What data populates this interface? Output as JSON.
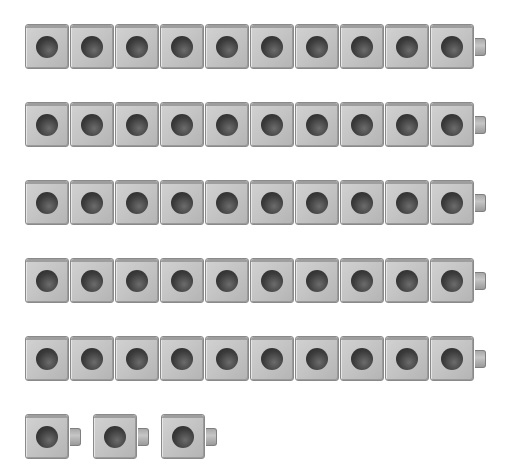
{
  "diagram": {
    "colors": {
      "cube": "#c4c4c4",
      "hole": "#333333",
      "background": "#ffffff"
    },
    "rods": [
      {
        "cubes": 10,
        "top": 24
      },
      {
        "cubes": 10,
        "top": 102
      },
      {
        "cubes": 10,
        "top": 180
      },
      {
        "cubes": 10,
        "top": 258
      },
      {
        "cubes": 10,
        "top": 336
      }
    ],
    "singles": {
      "count": 3,
      "top": 414
    },
    "total": 53
  }
}
